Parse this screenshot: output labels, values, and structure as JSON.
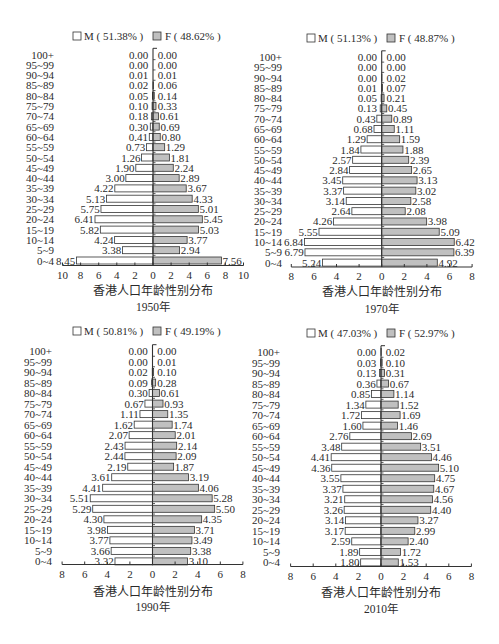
{
  "chart_data": [
    {
      "type": "bar",
      "orientation": "horizontal",
      "subtype": "population-pyramid",
      "title": "香港人口年龄性别分布",
      "subtitle": "1950年",
      "legend": [
        "M ( 51.38% )",
        "F ( 48.62% )"
      ],
      "legend_position": "top",
      "xlabel": "",
      "ylabel": "",
      "xlim": [
        -10,
        10
      ],
      "x_tick_labels": [
        "10",
        "8",
        "6",
        "4",
        "2",
        "0",
        "2",
        "4",
        "6",
        "8",
        "10"
      ],
      "grid": false,
      "categories": [
        "100+",
        "95~99",
        "90~94",
        "85~89",
        "80~84",
        "75~79",
        "70~74",
        "65~69",
        "60~64",
        "55~59",
        "50~54",
        "45~49",
        "40~44",
        "35~39",
        "30~34",
        "25~29",
        "20~24",
        "15~19",
        "10~14",
        "5~9",
        "0~4"
      ],
      "series": [
        {
          "name": "M",
          "share": "51.38%",
          "color": "#ffffff",
          "values": [
            0.0,
            0.0,
            0.01,
            0.02,
            0.05,
            0.1,
            0.18,
            0.3,
            0.41,
            0.73,
            1.26,
            1.9,
            3.0,
            4.22,
            5.13,
            5.75,
            6.41,
            5.82,
            4.24,
            3.38,
            8.45
          ]
        },
        {
          "name": "F",
          "share": "48.62%",
          "color": "#c0c0c0",
          "values": [
            0.0,
            0.0,
            0.01,
            0.06,
            0.14,
            0.33,
            0.61,
            0.69,
            0.8,
            1.29,
            1.81,
            2.24,
            2.89,
            3.67,
            4.33,
            5.01,
            5.45,
            5.03,
            3.77,
            2.94,
            7.56
          ]
        }
      ]
    },
    {
      "type": "bar",
      "orientation": "horizontal",
      "subtype": "population-pyramid",
      "title": "香港人口年龄性别分布",
      "subtitle": "1970年",
      "legend": [
        "M ( 51.13% )",
        "F ( 48.87% )"
      ],
      "legend_position": "top",
      "xlabel": "",
      "ylabel": "",
      "xlim": [
        -8,
        8
      ],
      "x_tick_labels": [
        "8",
        "6",
        "4",
        "2",
        "0",
        "2",
        "4",
        "6",
        "8"
      ],
      "grid": false,
      "categories": [
        "100+",
        "95~99",
        "90~94",
        "85~89",
        "80~84",
        "75~79",
        "70~74",
        "65~69",
        "60~64",
        "55~59",
        "50~54",
        "45~49",
        "40~44",
        "35~39",
        "30~34",
        "25~29",
        "20~24",
        "15~19",
        "10~14",
        "5~9",
        "0~4"
      ],
      "series": [
        {
          "name": "M",
          "share": "51.13%",
          "color": "#ffffff",
          "values": [
            0.0,
            0.0,
            0.0,
            0.01,
            0.05,
            0.13,
            0.43,
            0.68,
            1.29,
            1.84,
            2.57,
            2.84,
            3.45,
            3.37,
            3.14,
            2.64,
            4.26,
            5.55,
            6.84,
            6.79,
            5.24
          ]
        },
        {
          "name": "F",
          "share": "48.87%",
          "color": "#c0c0c0",
          "values": [
            0.0,
            0.0,
            0.02,
            0.07,
            0.21,
            0.45,
            0.89,
            1.11,
            1.59,
            1.88,
            2.39,
            2.65,
            3.13,
            3.02,
            2.58,
            2.08,
            3.98,
            5.09,
            6.42,
            6.39,
            4.92
          ]
        }
      ]
    },
    {
      "type": "bar",
      "orientation": "horizontal",
      "subtype": "population-pyramid",
      "title": "香港人口年龄性别分布",
      "subtitle": "1990年",
      "legend": [
        "M ( 50.81% )",
        "F ( 49.19% )"
      ],
      "legend_position": "top",
      "xlabel": "",
      "ylabel": "",
      "xlim": [
        -8,
        8
      ],
      "x_tick_labels": [
        "8",
        "6",
        "4",
        "2",
        "0",
        "2",
        "4",
        "6",
        "8"
      ],
      "grid": false,
      "categories": [
        "100+",
        "95~99",
        "90~94",
        "85~89",
        "80~84",
        "75~79",
        "70~74",
        "65~69",
        "60~64",
        "55~59",
        "50~54",
        "45~49",
        "40~44",
        "35~39",
        "30~34",
        "25~29",
        "20~24",
        "15~19",
        "10~14",
        "5~9",
        "0~4"
      ],
      "series": [
        {
          "name": "M",
          "share": "50.81%",
          "color": "#ffffff",
          "values": [
            0.0,
            0.0,
            0.02,
            0.09,
            0.3,
            0.67,
            1.11,
            1.62,
            2.07,
            2.43,
            2.44,
            2.19,
            3.61,
            4.41,
            5.51,
            5.29,
            4.3,
            3.98,
            3.77,
            3.66,
            3.32
          ]
        },
        {
          "name": "F",
          "share": "49.19%",
          "color": "#c0c0c0",
          "values": [
            0.0,
            0.01,
            0.1,
            0.28,
            0.61,
            0.93,
            1.35,
            1.74,
            2.01,
            2.14,
            2.09,
            1.87,
            3.19,
            4.06,
            5.28,
            5.5,
            4.35,
            3.71,
            3.49,
            3.38,
            3.1
          ]
        }
      ]
    },
    {
      "type": "bar",
      "orientation": "horizontal",
      "subtype": "population-pyramid",
      "title": "香港人口年龄性别分布",
      "subtitle": "2010年",
      "legend": [
        "M ( 47.03% )",
        "F ( 52.97% )"
      ],
      "legend_position": "top",
      "xlabel": "",
      "ylabel": "",
      "xlim": [
        -8,
        8
      ],
      "x_tick_labels": [
        "8",
        "6",
        "4",
        "2",
        "0",
        "2",
        "4",
        "6",
        "8"
      ],
      "grid": false,
      "categories": [
        "100+",
        "95~99",
        "90~94",
        "85~89",
        "80~84",
        "75~79",
        "70~74",
        "65~69",
        "60~64",
        "55~59",
        "50~54",
        "45~49",
        "40~44",
        "35~39",
        "30~34",
        "25~29",
        "20~24",
        "15~19",
        "10~14",
        "5~9",
        "0~4"
      ],
      "series": [
        {
          "name": "M",
          "share": "47.03%",
          "color": "#ffffff",
          "values": [
            0.0,
            0.03,
            0.13,
            0.36,
            0.85,
            1.34,
            1.72,
            1.6,
            2.76,
            3.48,
            4.41,
            4.36,
            3.55,
            3.37,
            3.21,
            3.26,
            3.14,
            3.17,
            2.59,
            1.89,
            1.8
          ]
        },
        {
          "name": "F",
          "share": "52.97%",
          "color": "#c0c0c0",
          "values": [
            0.02,
            0.1,
            0.31,
            0.67,
            1.14,
            1.52,
            1.69,
            1.46,
            2.69,
            3.51,
            4.46,
            5.1,
            4.75,
            4.67,
            4.56,
            4.4,
            3.27,
            2.99,
            2.4,
            1.72,
            1.53
          ]
        }
      ]
    }
  ]
}
